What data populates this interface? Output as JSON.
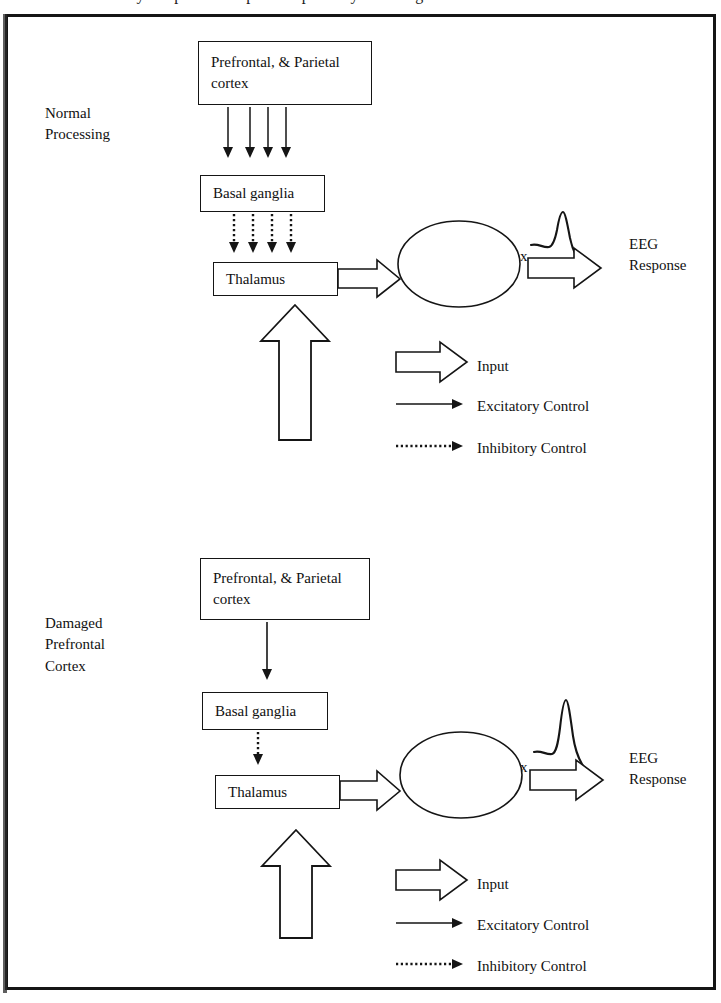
{
  "figure": {
    "top_cut_text": "cortex. Only the prefrontal/parietal pathway is damaged",
    "border_color": "#151515",
    "background": "#ffffff"
  },
  "sections": [
    {
      "id": "normal",
      "side_label": "Normal\nProcessing",
      "nodes": {
        "cortex_box": "Prefrontal, &\nParietal cortex",
        "basal_box": "Basal ganglia",
        "thalamus_box": "Thalamus",
        "auditory_ellipse": "Auditory\ncortex",
        "eeg_label": "EEG\nResponse"
      },
      "excitatory_arrow_count": 4,
      "inhibitory_arrow_count": 4,
      "legend": [
        {
          "symbol": "block-arrow-icon",
          "label": "Input"
        },
        {
          "symbol": "solid-arrow-icon",
          "label": "Excitatory Control"
        },
        {
          "symbol": "dotted-arrow-icon",
          "label": "Inhibitory Control"
        }
      ]
    },
    {
      "id": "damaged",
      "side_label": "Damaged\nPrefrontal\nCortex",
      "nodes": {
        "cortex_box": "Prefrontal, &\nParietal cortex",
        "basal_box": "Basal ganglia",
        "thalamus_box": "Thalamus",
        "auditory_ellipse": "Auditory\ncortex",
        "eeg_label": "EEG\nResponse"
      },
      "excitatory_arrow_count": 1,
      "inhibitory_arrow_count": 1,
      "legend": [
        {
          "symbol": "block-arrow-icon",
          "label": "Input"
        },
        {
          "symbol": "solid-arrow-icon",
          "label": "Excitatory Control"
        },
        {
          "symbol": "dotted-arrow-icon",
          "label": "Inhibitory Control"
        }
      ]
    }
  ]
}
